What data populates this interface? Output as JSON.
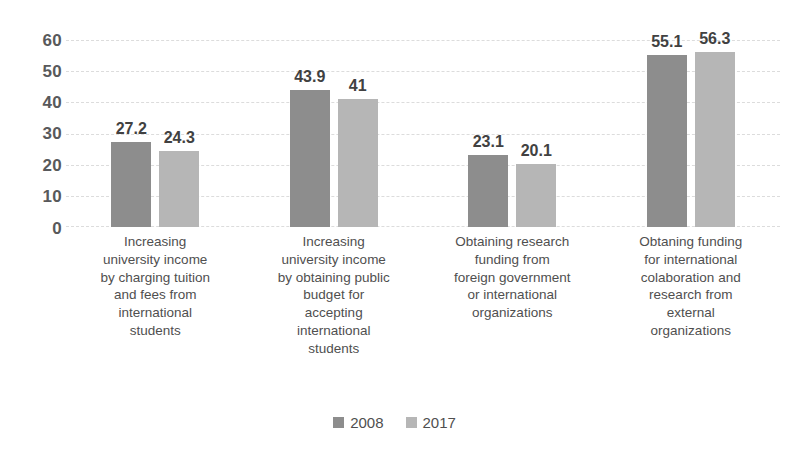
{
  "chart_data": {
    "type": "bar",
    "title": "",
    "subtitle": "",
    "xlabel": "",
    "ylabel": "",
    "ylim": [
      0,
      60
    ],
    "yticks": [
      0,
      10,
      20,
      30,
      40,
      50,
      60
    ],
    "grid": true,
    "legend_position": "bottom",
    "categories": [
      "Increasing university income by charging tuition and fees from international students",
      "Increasing university income by obtaining public budget for accepting international students",
      "Obtaining research funding from foreign government or international organizations",
      "Obtaning funding for international colaboration and research from external organizations"
    ],
    "series": [
      {
        "name": "2008",
        "color": "#8d8d8d",
        "values": [
          27.2,
          43.9,
          23.1,
          55.1
        ],
        "labels": [
          "27.2",
          "43.9",
          "23.1",
          "55.1"
        ]
      },
      {
        "name": "2017",
        "color": "#b6b6b6",
        "values": [
          24.3,
          41,
          20.1,
          56.3
        ],
        "labels": [
          "24.3",
          "41",
          "20.1",
          "56.3"
        ]
      }
    ]
  },
  "axis": {
    "y_tick_labels": [
      "60",
      "50",
      "40",
      "30",
      "20",
      "10",
      "0"
    ]
  },
  "category_lines": [
    [
      "Increasing",
      "university income",
      "by charging tuition",
      "and fees from",
      "international",
      "students"
    ],
    [
      "Increasing",
      "university income",
      "by obtaining public",
      "budget for",
      "accepting",
      "international",
      "students"
    ],
    [
      "Obtaining research",
      "funding from",
      "foreign government",
      "or international",
      "organizations"
    ],
    [
      "Obtaning funding",
      "for international",
      "colaboration and",
      "research from",
      "external",
      "organizations"
    ]
  ],
  "legend": {
    "items": [
      {
        "label": "2008",
        "color": "#8d8d8d"
      },
      {
        "label": "2017",
        "color": "#b6b6b6"
      }
    ]
  }
}
